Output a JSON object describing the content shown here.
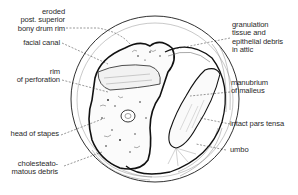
{
  "figure": {
    "line_color": "#1a1a1a",
    "background": "#ffffff"
  },
  "labels": {
    "left": [
      {
        "id": "eroded-bony-drum-rim",
        "lines": [
          "eroded",
          "post. superior",
          "bony drum rim"
        ]
      },
      {
        "id": "facial-canal",
        "lines": [
          "facial canal"
        ]
      },
      {
        "id": "rim-of-perforation",
        "lines": [
          "rim",
          "of perforation"
        ]
      },
      {
        "id": "head-of-stapes",
        "lines": [
          "head of stapes"
        ]
      },
      {
        "id": "cholesteatomatous-debris",
        "lines": [
          "cholesteato-",
          "matous debris"
        ]
      }
    ],
    "right": [
      {
        "id": "granulation-tissue",
        "lines": [
          "granulation",
          "tissue and",
          "epithelial debris",
          "in attic"
        ]
      },
      {
        "id": "manubrium-of-malleus",
        "lines": [
          "manubrium",
          "of malleus"
        ]
      },
      {
        "id": "intact-pars-tensa",
        "lines": [
          "intact pars tensa"
        ]
      },
      {
        "id": "umbo",
        "lines": [
          "umbo"
        ]
      }
    ]
  }
}
